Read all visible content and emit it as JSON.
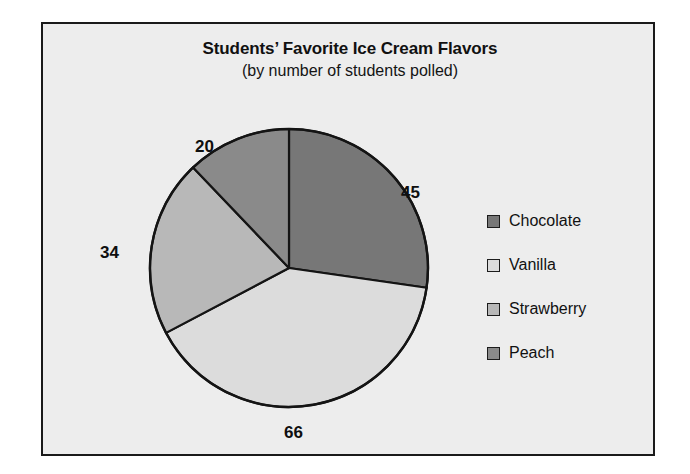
{
  "frame": {
    "border_color": "#1a1a1a",
    "background": "#ededed",
    "page_background": "#ffffff"
  },
  "chart_data": {
    "type": "pie",
    "title": "Students’ Favorite Ice Cream Flavors",
    "subtitle": "(by number of students polled)",
    "xlabel": "",
    "ylabel": "",
    "grid": false,
    "legend_position": "right",
    "total": 165,
    "start_angle_deg": 0,
    "direction": "clockwise",
    "categories": [
      "Chocolate",
      "Vanilla",
      "Strawberry",
      "Peach"
    ],
    "values": [
      45,
      66,
      34,
      20
    ],
    "colors": [
      "#777777",
      "#dcdcdc",
      "#b8b8b8",
      "#8a8a8a"
    ],
    "slice_outline_color": "#141414",
    "slices": [
      {
        "label": "Chocolate",
        "value": 45,
        "color": "#777777"
      },
      {
        "label": "Vanilla",
        "value": 66,
        "color": "#dcdcdc"
      },
      {
        "label": "Strawberry",
        "value": 34,
        "color": "#b8b8b8"
      },
      {
        "label": "Peach",
        "value": 20,
        "color": "#8a8a8a"
      }
    ],
    "data_labels": [
      "45",
      "66",
      "34",
      "20"
    ]
  },
  "labels": {
    "chocolate": "45",
    "vanilla": "66",
    "strawberry": "34",
    "peach": "20"
  },
  "legend": {
    "items": [
      {
        "label": "Chocolate",
        "color": "#777777"
      },
      {
        "label": "Vanilla",
        "color": "#dcdcdc"
      },
      {
        "label": "Strawberry",
        "color": "#b8b8b8"
      },
      {
        "label": "Peach",
        "color": "#8a8a8a"
      }
    ]
  }
}
